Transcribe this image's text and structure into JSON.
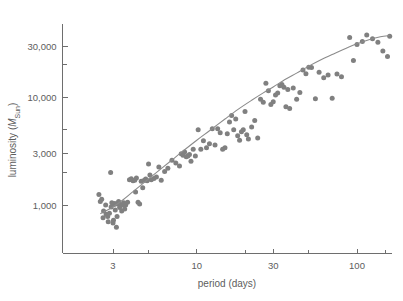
{
  "figure": {
    "background_color": "#ffffff",
    "axis_color": "#6e6e6e",
    "marker_color": "#808080",
    "curve_color": "#8b8b8b",
    "text_color": "#5d5d5d"
  },
  "axes": {
    "x_title": "period (days)",
    "y_title_prefix": "luminosity (",
    "y_title_symbol": "M",
    "y_title_subscript": "Sun",
    "y_title_suffix": ")",
    "x_tick_labels": [
      "3",
      "10",
      "30",
      "100"
    ],
    "y_tick_labels": [
      "1,000",
      "3,000",
      "10,000",
      "30,000"
    ]
  },
  "chart_data": {
    "type": "scatter",
    "title": "",
    "xlabel": "period (days)",
    "ylabel": "luminosity (M_Sun)",
    "xscale": "log",
    "yscale": "log",
    "xlim": [
      2.0,
      170
    ],
    "ylim": [
      520,
      52000
    ],
    "grid": false,
    "legend": false,
    "x_ticks": [
      3,
      10,
      30,
      100
    ],
    "x_tick_labels": [
      "3",
      "10",
      "30",
      "100"
    ],
    "x_minor_ticks": [
      5,
      20,
      50,
      150
    ],
    "y_ticks": [
      1000,
      3000,
      10000,
      30000
    ],
    "y_tick_labels": [
      "1,000",
      "3,000",
      "10,000",
      "30,000"
    ],
    "y_minor_ticks": [
      2000,
      5000,
      20000,
      50000
    ],
    "series": [
      {
        "name": "Cepheid variables",
        "marker": "circle",
        "color": "#808080",
        "x": [
          2.45,
          2.5,
          2.55,
          2.6,
          2.62,
          2.7,
          2.72,
          2.78,
          2.8,
          2.85,
          2.9,
          2.92,
          2.95,
          3.0,
          3.02,
          3.05,
          3.08,
          3.1,
          3.15,
          3.18,
          3.2,
          3.25,
          3.3,
          3.35,
          3.4,
          3.45,
          3.5,
          3.55,
          3.6,
          3.7,
          3.8,
          3.9,
          4.0,
          4.1,
          4.15,
          4.2,
          4.3,
          4.4,
          4.5,
          4.6,
          4.7,
          4.8,
          4.9,
          5.0,
          5.1,
          5.2,
          5.4,
          5.6,
          5.8,
          6.0,
          6.3,
          6.6,
          7.0,
          7.4,
          7.8,
          8.0,
          8.2,
          8.4,
          8.6,
          8.8,
          9.0,
          9.2,
          9.5,
          9.8,
          10.2,
          10.6,
          11.0,
          11.5,
          12.0,
          12.5,
          13.0,
          13.5,
          14.0,
          14.5,
          15.0,
          15.5,
          16.0,
          16.5,
          17.0,
          17.5,
          18.0,
          18.5,
          19.0,
          19.5,
          20.0,
          20.5,
          21.0,
          22.0,
          23.0,
          24.0,
          25.0,
          26.0,
          27.0,
          28.0,
          29.0,
          30.0,
          31.0,
          32.0,
          33.0,
          34.0,
          35.0,
          36.0,
          37.0,
          38.0,
          40.0,
          42.0,
          44.0,
          46.0,
          48.0,
          50.0,
          52.0,
          55.0,
          58.0,
          62.0,
          66.0,
          70.0,
          75.0,
          80.0,
          90.0,
          95.0,
          100.0,
          108.0,
          115.0,
          125.0,
          135.0,
          145.0,
          155.0,
          160.0
        ],
        "y": [
          1250,
          1080,
          1130,
          760,
          880,
          1000,
          820,
          780,
          700,
          840,
          2000,
          960,
          1050,
          680,
          720,
          1010,
          1030,
          900,
          620,
          780,
          1020,
          1080,
          950,
          1010,
          880,
          1000,
          1050,
          920,
          1000,
          1060,
          1720,
          1750,
          1680,
          1700,
          1320,
          1780,
          1060,
          1020,
          1660,
          1450,
          1700,
          1740,
          1680,
          2400,
          1900,
          1720,
          1760,
          1820,
          2250,
          1700,
          2050,
          2200,
          2600,
          2450,
          2300,
          3000,
          2900,
          3100,
          2800,
          2850,
          2950,
          2550,
          3300,
          2850,
          5000,
          3300,
          3950,
          3400,
          3700,
          5100,
          3600,
          5100,
          4700,
          3300,
          3400,
          4600,
          5900,
          6800,
          5000,
          6300,
          4400,
          4000,
          4800,
          5000,
          7400,
          4500,
          4100,
          5300,
          6100,
          4200,
          9600,
          9000,
          13500,
          11500,
          8600,
          9100,
          10500,
          11000,
          12800,
          13200,
          12400,
          8200,
          11800,
          7900,
          12200,
          9600,
          11100,
          18000,
          16600,
          19000,
          18900,
          9700,
          17100,
          15200,
          16100,
          9800,
          16500,
          15500,
          36000,
          22000,
          31000,
          33000,
          38000,
          35000,
          32500,
          27000,
          24000,
          37000
        ]
      }
    ],
    "fit_curve": {
      "name": "power-law trend with high-period flattening",
      "color": "#8b8b8b",
      "x": [
        2.5,
        3.0,
        3.5,
        4.0,
        5.0,
        6.0,
        7.0,
        8.0,
        10.0,
        12.0,
        15.0,
        18.0,
        22.0,
        26.0,
        30.0,
        36.0,
        42.0,
        50.0,
        60.0,
        70.0,
        85.0,
        100.0,
        120.0,
        140.0,
        160.0
      ],
      "y": [
        830,
        960,
        1130,
        1330,
        1750,
        2180,
        2620,
        3080,
        4000,
        4900,
        6300,
        7700,
        9400,
        11000,
        12500,
        14800,
        16800,
        19500,
        22500,
        25000,
        28500,
        31500,
        34500,
        36500,
        37500
      ]
    },
    "annotations": []
  }
}
